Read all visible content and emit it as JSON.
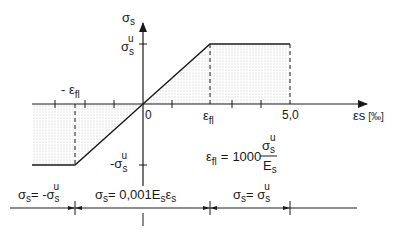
{
  "axes": {
    "y_label": "σs",
    "x_label": "εs",
    "x_unit": "[‰]",
    "origin_label": "0"
  },
  "y_ticks": {
    "upper": {
      "base": "σ",
      "sub": "s",
      "sup": "u",
      "prefix": ""
    },
    "lower": {
      "base": "σ",
      "sub": "s",
      "sup": "u",
      "prefix": "-"
    }
  },
  "x_ticks": {
    "neg_yield": {
      "prefix": "- ",
      "base": "ε",
      "sub": "fl"
    },
    "pos_yield": {
      "prefix": "",
      "base": "ε",
      "sub": "fl"
    },
    "ultimate": "5,0"
  },
  "formula": {
    "lhs_base": "ε",
    "lhs_sub": "fl",
    "equals": "=",
    "factor": "1000",
    "numerator_base": "σ",
    "numerator_sub": "s",
    "numerator_sup": "u",
    "denominator_base": "E",
    "denominator_sub": "s"
  },
  "zones": [
    {
      "label_parts": [
        "σ",
        "s",
        "= -σ",
        "s",
        "u"
      ],
      "text": "σs = -σs^u"
    },
    {
      "label_parts": [
        "σ",
        "s",
        "= 0,001E",
        "s",
        "ε",
        "s"
      ],
      "text": "σs = 0,001 Es εs"
    },
    {
      "label_parts": [
        "σ",
        "s",
        "= σ",
        "s",
        "u"
      ],
      "text": "σs = σs^u"
    }
  ],
  "curve": {
    "description": "Elastic-perfectly-plastic: linear through origin between -εfl and εfl, constant ±σs^u beyond, up to 5,0‰",
    "points_strain_permil": [
      -5.0,
      -2.17,
      0,
      2.17,
      5.0
    ],
    "points_stress": [
      "-σs^u",
      "-σs^u",
      "0",
      "σs^u",
      "σs^u"
    ]
  },
  "colors": {
    "line": "#1a1a1a",
    "hatch_dot": "#9a9a9a",
    "background": "#ffffff"
  }
}
